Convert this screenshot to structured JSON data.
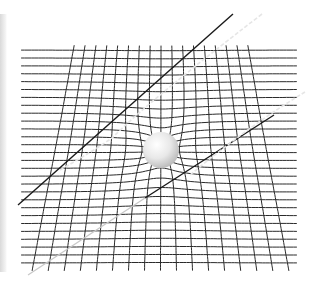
{
  "diagram": {
    "grid": {
      "horizontal_line_count": 28,
      "vertical_line_count": 17,
      "line_color": "#2a2a2a"
    },
    "mass": {
      "label": "massive body",
      "color": "#e8e8e8",
      "highlight_color": "#ffffff"
    },
    "light_paths": [
      {
        "name": "upper-light-path",
        "color": "#1a1a1a",
        "style": "solid"
      },
      {
        "name": "upper-deflected-path",
        "color": "#e6e6e6",
        "style": "dashed"
      },
      {
        "name": "lower-light-path",
        "color": "#1a1a1a",
        "style": "solid"
      },
      {
        "name": "lower-light-path-tail",
        "color": "#c8c8c8",
        "style": "solid"
      },
      {
        "name": "lower-deflected-path",
        "color": "#e6e6e6",
        "style": "dashed"
      }
    ],
    "background_color": "#ffffff"
  }
}
